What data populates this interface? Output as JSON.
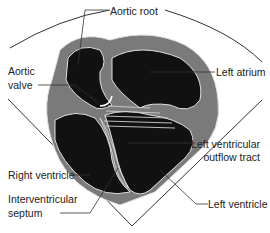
{
  "diagram": {
    "labels": {
      "aortic_root": "Aortic root",
      "aortic_valve_line1": "Aortic",
      "aortic_valve_line2": "valve",
      "left_atrium": "Left atrium",
      "lvot_line1": "Left ventricular",
      "lvot_line2": "outflow tract",
      "right_ventricle": "Right ventricle",
      "left_ventricle": "Left ventricle",
      "ivs_line1": "Interventricular",
      "ivs_line2": "septum"
    },
    "colors": {
      "chamber": "#111111",
      "wall": "#7a7a7a",
      "outline": "#e0e0e0",
      "leader": "#333333",
      "valve": "#ffffff"
    }
  }
}
